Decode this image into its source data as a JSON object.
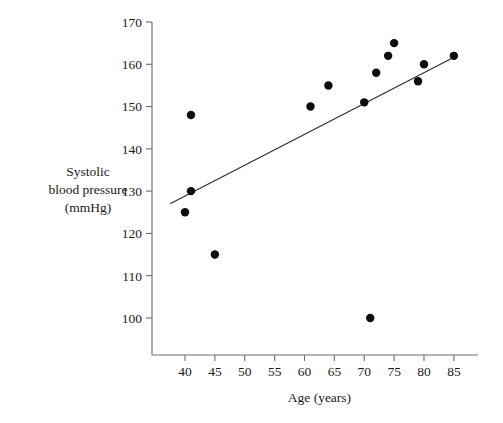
{
  "chart_data": {
    "type": "scatter",
    "title": "",
    "xlabel": "Age (years)",
    "ylabel": "Systolic blood pressure (mmHg)",
    "ylabel_lines": [
      "Systolic",
      "blood pressure",
      "(mmHg)"
    ],
    "grid": false,
    "legend": false,
    "legend_position": "none",
    "xlim": [
      37,
      88
    ],
    "ylim": [
      95,
      172
    ],
    "xticks": [
      40,
      45,
      50,
      55,
      60,
      65,
      70,
      75,
      80,
      85
    ],
    "yticks": [
      100,
      110,
      120,
      130,
      140,
      150,
      160,
      170
    ],
    "xtick_labels": [
      "40",
      "45",
      "50",
      "55",
      "60",
      "65",
      "70",
      "75",
      "80",
      "85"
    ],
    "ytick_labels": [
      "100",
      "110",
      "120",
      "130",
      "140",
      "150",
      "160",
      "170"
    ],
    "x": [
      41,
      41,
      40,
      45,
      61,
      64,
      70,
      71,
      72,
      74,
      75,
      79,
      80,
      85
    ],
    "y": [
      148,
      130,
      125,
      115,
      150,
      155,
      151,
      100,
      158,
      162,
      165,
      156,
      160,
      162
    ],
    "points": [
      {
        "x": 41,
        "y": 148
      },
      {
        "x": 41,
        "y": 130
      },
      {
        "x": 40,
        "y": 125
      },
      {
        "x": 45,
        "y": 115
      },
      {
        "x": 61,
        "y": 150
      },
      {
        "x": 64,
        "y": 155
      },
      {
        "x": 70,
        "y": 151
      },
      {
        "x": 71,
        "y": 100
      },
      {
        "x": 72,
        "y": 158
      },
      {
        "x": 74,
        "y": 162
      },
      {
        "x": 75,
        "y": 165
      },
      {
        "x": 79,
        "y": 156
      },
      {
        "x": 80,
        "y": 160
      },
      {
        "x": 85,
        "y": 162
      }
    ],
    "marker_color": "#0d0d0d",
    "marker_size": 4.2,
    "trendline": {
      "type": "line",
      "x_start": 37.5,
      "y_start": 127,
      "x_end": 85.5,
      "y_end": 162,
      "color": "#2b2b2b"
    },
    "axis_color": "#6e6e6e",
    "plot_box": {
      "left_px": 152,
      "right_px": 478,
      "top_px": 22,
      "bottom_px": 355
    }
  }
}
